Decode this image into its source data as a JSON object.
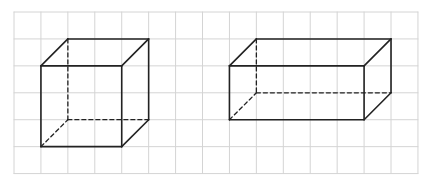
{
  "diagram": {
    "title": "",
    "grid": {
      "origin_x": 14,
      "origin_y": 12,
      "cell": 26.93,
      "cols": 15,
      "rows": 6,
      "color": "#d4d4d4"
    },
    "line_color": "#222222",
    "shapes": [
      {
        "name": "cube",
        "front": {
          "x": 1,
          "y": 2,
          "w": 3,
          "h": 3
        },
        "offset": {
          "dx": 1,
          "dy": -1
        }
      },
      {
        "name": "rectangular-prism",
        "front": {
          "x": 8,
          "y": 2,
          "w": 5,
          "h": 2
        },
        "offset": {
          "dx": 1,
          "dy": -1
        }
      }
    ]
  }
}
